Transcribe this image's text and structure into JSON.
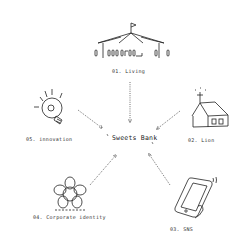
{
  "diagram": {
    "center": {
      "label": "Sweets Bank"
    },
    "nodes": [
      {
        "id": "living",
        "label": "01. Living",
        "icon": "circus-tent-icon"
      },
      {
        "id": "lion",
        "label": "02. Lion",
        "icon": "house-icon"
      },
      {
        "id": "sns",
        "label": "03. SNS",
        "icon": "smartphone-icon"
      },
      {
        "id": "corporate",
        "label": "04. Corporate identity",
        "icon": "flower-emblem-icon"
      },
      {
        "id": "innovation",
        "label": "05. innovation",
        "icon": "lightbulb-icon"
      }
    ],
    "edges": [
      {
        "from": "living",
        "to": "center",
        "style": "dotted"
      },
      {
        "from": "lion",
        "to": "center",
        "style": "dotted"
      },
      {
        "from": "sns",
        "to": "center",
        "style": "dotted"
      },
      {
        "from": "corporate",
        "to": "center",
        "style": "dotted"
      },
      {
        "from": "innovation",
        "to": "center",
        "style": "dotted"
      }
    ],
    "colors": {
      "ink": "#222222",
      "background": "#ffffff"
    }
  }
}
